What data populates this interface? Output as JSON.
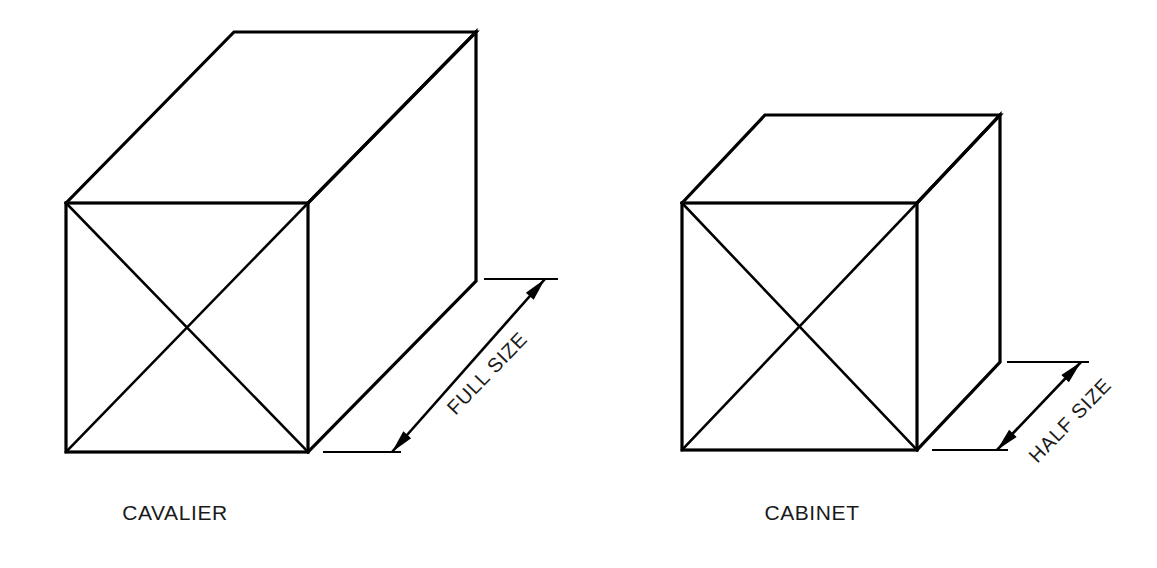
{
  "page": {
    "background_color": "#ffffff",
    "ink_color": "#000000",
    "width": 1157,
    "height": 568
  },
  "figures": [
    {
      "id": "cavalier",
      "caption": "CAVALIER",
      "caption_x": 175,
      "caption_y": 520,
      "dimension_label": "FULL SIZE",
      "dimension_label_x": 492,
      "dimension_label_y": 378,
      "dimension_label_rotation": -46,
      "front_face": {
        "left": 66,
        "top": 203,
        "right": 308,
        "bottom": 452
      },
      "depth_offset": {
        "dx": 168,
        "dy": -171
      },
      "depth_ratio": "1:1",
      "receding_angle_deg": 45,
      "front_face_diagonals": true,
      "dimension_arrow": {
        "x1": 392,
        "y1": 452,
        "x2": 545,
        "y2": 279
      },
      "extension_lines": [
        {
          "x1": 323,
          "y1": 452,
          "x2": 401,
          "y2": 452
        },
        {
          "x1": 484,
          "y1": 279,
          "x2": 558,
          "y2": 279
        }
      ]
    },
    {
      "id": "cabinet",
      "caption": "CABINET",
      "caption_x": 812,
      "caption_y": 520,
      "dimension_label": "HALF SIZE",
      "dimension_label_x": 1075,
      "dimension_label_y": 425,
      "dimension_label_rotation": -46,
      "front_face": {
        "left": 682,
        "top": 203,
        "right": 917,
        "bottom": 450
      },
      "depth_offset": {
        "dx": 83,
        "dy": -88
      },
      "depth_ratio": "1:2",
      "receding_angle_deg": 45,
      "front_face_diagonals": true,
      "dimension_arrow": {
        "x1": 997,
        "y1": 450,
        "x2": 1081,
        "y2": 362
      },
      "extension_lines": [
        {
          "x1": 932,
          "y1": 450,
          "x2": 1008,
          "y2": 450
        },
        {
          "x1": 1007,
          "y1": 362,
          "x2": 1089,
          "y2": 362
        }
      ]
    }
  ]
}
